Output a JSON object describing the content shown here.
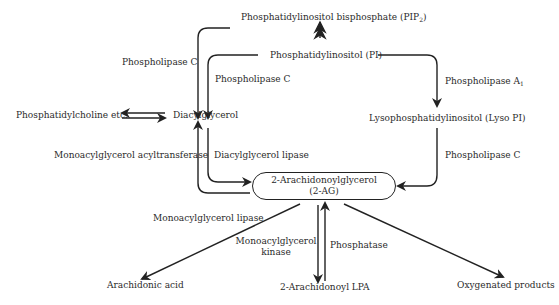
{
  "diagram": {
    "nodes": {
      "pip2": {
        "label": "Phosphatidylinositol bisphosphate (PIP",
        "sub": "2",
        "suffix": ")"
      },
      "pi": {
        "label": "Phosphatidylinositol (PI)"
      },
      "pc": {
        "label": "Phosphatidylcholine etc."
      },
      "dag": {
        "label": "Diacylglycerol"
      },
      "lysopi": {
        "label": "Lysophosphatidylinositol (Lyso PI)"
      },
      "ag_line1": {
        "label": "2-Arachidonoylglycerol"
      },
      "ag_line2": {
        "label": "(2-AG)"
      },
      "aa": {
        "label": "Arachidonic acid"
      },
      "lpa": {
        "label": "2-Arachidonoyl LPA"
      },
      "oxy": {
        "label": "Oxygenated products"
      }
    },
    "enzymes": {
      "plc_outer": "Phospholipase C",
      "plc_inner": "Phospholipase C",
      "pla1": "Phospholipase A",
      "pla1_sub": "1",
      "plc_lyso": "Phospholipase C",
      "mgat": "Monoacylglycerol acyltransferase",
      "dagl": "Diacylglycerol lipase",
      "magl": "Monoacylglycerol lipase",
      "mgk_line1": "Monoacylglycerol",
      "mgk_line2": "kinase",
      "phosphatase": "Phosphatase"
    },
    "colors": {
      "stroke": "#222222",
      "text": "#2a2a2a",
      "background": "#ffffff"
    }
  }
}
